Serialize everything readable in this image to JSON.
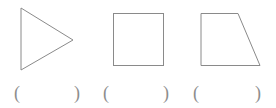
{
  "page": {
    "background_color": "#ffffff",
    "width": 276,
    "height": 108,
    "stroke_color": "#8a8a8a",
    "stroke_width": 1,
    "fill": "none",
    "text_color": "#8d8d8d"
  },
  "worksheet": {
    "title": "",
    "instruction": "",
    "item_count": 3
  },
  "shapes": [
    {
      "name": "triangle",
      "label": "right-pointing triangle",
      "type": "polygon",
      "points": "21,8 21,70 73,40",
      "vertices": [
        [
          21,
          8
        ],
        [
          21,
          70
        ],
        [
          73,
          40
        ]
      ],
      "fill": "none",
      "stroke": "#8a8a8a"
    },
    {
      "name": "square",
      "label": "square",
      "type": "rect",
      "x": 113,
      "y": 13,
      "width": 51,
      "height": 53,
      "fill": "none",
      "stroke": "#8a8a8a"
    },
    {
      "name": "trapezoid",
      "label": "right trapezoid",
      "type": "polygon",
      "points": "201,13 238,13 260,66 201,66",
      "vertices": [
        [
          201,
          13
        ],
        [
          238,
          13
        ],
        [
          260,
          66
        ],
        [
          201,
          66
        ]
      ],
      "fill": "none",
      "stroke": "#8a8a8a"
    }
  ],
  "answer_blanks": [
    {
      "name": "answer-blank-1",
      "open": "(",
      "close": ")",
      "value": ""
    },
    {
      "name": "answer-blank-2",
      "open": "(",
      "close": ")",
      "value": ""
    },
    {
      "name": "answer-blank-3",
      "open": "(",
      "close": ")",
      "value": ""
    }
  ]
}
